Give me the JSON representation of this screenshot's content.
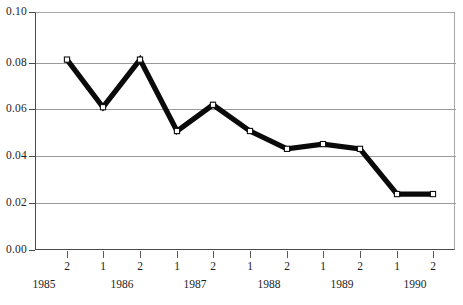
{
  "chart_data": {
    "type": "line",
    "title": "",
    "subtitle": "",
    "xlabel": "",
    "ylabel": "",
    "ylim": [
      0.0,
      0.1
    ],
    "ytick_labels": [
      "0.10",
      "0.08",
      "0.06",
      "0.04",
      "0.02",
      "0.00"
    ],
    "ytick_values": [
      0.1,
      0.08,
      0.06,
      0.04,
      0.02,
      0.0
    ],
    "grid": "horizontal",
    "legend": "none",
    "categories": [
      "2",
      "1",
      "2",
      "1",
      "2",
      "1",
      "2",
      "1",
      "2",
      "1",
      "2"
    ],
    "year_groups": [
      {
        "label": "1985",
        "span": 1
      },
      {
        "label": "1986",
        "span": 2
      },
      {
        "label": "1987",
        "span": 2
      },
      {
        "label": "1988",
        "span": 2
      },
      {
        "label": "1989",
        "span": 2
      },
      {
        "label": "1990",
        "span": 2
      }
    ],
    "series": [
      {
        "name": "series-1",
        "values": [
          0.08,
          0.06,
          0.08,
          0.05,
          0.061,
          0.05,
          0.0425,
          0.0445,
          0.0425,
          0.0235,
          0.0235
        ],
        "marker": "open-square",
        "line_color": "#0a0a0a",
        "marker_fill": "#ffffff"
      }
    ]
  },
  "axes": {
    "grid_color": "#9a9a9a",
    "frame_color": "#4a4a4a",
    "background": "#ffffff"
  }
}
